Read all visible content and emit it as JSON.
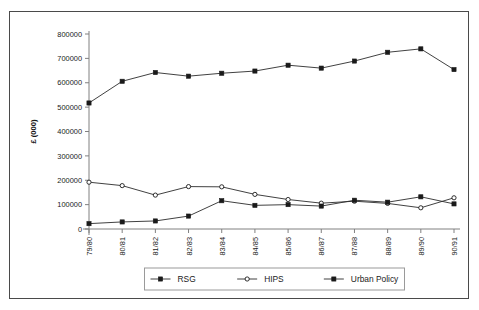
{
  "figure": {
    "clipped_header_text": "",
    "frame_border_color": "#4a4a4a",
    "background_color": "#ffffff"
  },
  "chart_data": {
    "type": "line",
    "title": "",
    "xlabel": "",
    "ylabel": "£ (000)",
    "categories": [
      "79/80",
      "80/81",
      "81/82",
      "82/83",
      "83/84",
      "84/85",
      "85/86",
      "86/87",
      "87/88",
      "88/89",
      "89/90",
      "90/91"
    ],
    "ylim": [
      0,
      800000
    ],
    "ytick_values": [
      0,
      100000,
      200000,
      300000,
      400000,
      500000,
      600000,
      700000,
      800000
    ],
    "ytick_labels": [
      "0",
      "100000",
      "200000",
      "300000",
      "400000",
      "500000",
      "600000",
      "700000",
      "800000"
    ],
    "grid": false,
    "legend_position": "bottom",
    "series": [
      {
        "name": "RSG",
        "marker": "filled-square",
        "color": "#1a1a1a",
        "values": [
          517000,
          606000,
          642000,
          627000,
          639000,
          648000,
          672000,
          660000,
          689000,
          725000,
          739000,
          654000
        ]
      },
      {
        "name": "HIPS",
        "marker": "open-circle",
        "color": "#1a1a1a",
        "values": [
          192000,
          178000,
          139000,
          174000,
          173000,
          142000,
          121000,
          106000,
          114000,
          105000,
          87000,
          128000
        ]
      },
      {
        "name": "Urban Policy",
        "marker": "filled-square",
        "color": "#1a1a1a",
        "values": [
          22000,
          29000,
          33000,
          53000,
          116000,
          97000,
          100000,
          94000,
          118000,
          110000,
          132000,
          103000
        ]
      }
    ]
  }
}
